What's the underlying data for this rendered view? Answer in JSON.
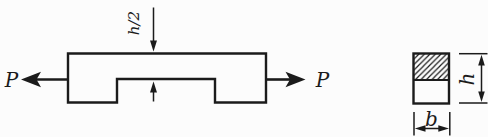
{
  "labels": {
    "force_left": "P",
    "force_right": "P",
    "notch_depth": "h/2",
    "section_height": "h",
    "section_width": "b"
  },
  "colors": {
    "ink": "#1b1b1b",
    "background": "#fcfcfc",
    "hatch": "#1b1b1b"
  }
}
